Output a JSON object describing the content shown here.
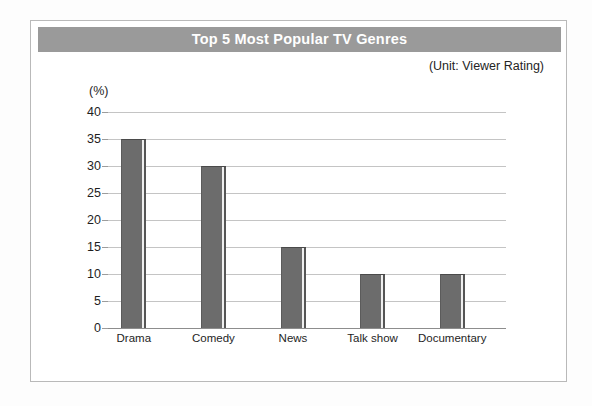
{
  "chart": {
    "title": "Top 5 Most Popular TV Genres",
    "unit_note": "(Unit: Viewer Rating)",
    "axis_unit_label": "(%)"
  },
  "chart_data": {
    "type": "bar",
    "title": "Top 5 Most Popular TV Genres",
    "subtitle": "(Unit: Viewer Rating)",
    "categories": [
      "Drama",
      "Comedy",
      "News",
      "Talk show",
      "Documentary"
    ],
    "values": [
      35,
      30,
      15,
      10,
      10
    ],
    "xlabel": "",
    "ylabel": "(%)",
    "ylim": [
      0,
      40
    ],
    "yticks": [
      0,
      5,
      10,
      15,
      20,
      25,
      30,
      35,
      40
    ],
    "ytick_labels": [
      "0",
      "5",
      "10",
      "15",
      "20",
      "25",
      "30",
      "35",
      "40"
    ],
    "grid": true,
    "legend": false,
    "bar_color": "#6c6c6c",
    "title_banner_color": "#9a9a9a",
    "title_text_color": "#ffffff"
  }
}
